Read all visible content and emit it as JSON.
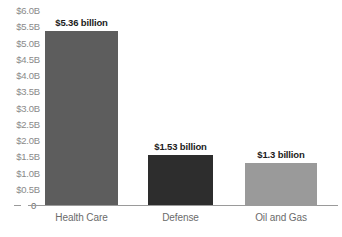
{
  "chart_data": {
    "type": "bar",
    "title": "",
    "subtitle": "",
    "xlabel": "",
    "ylabel": "",
    "categories": [
      "Health Care",
      "Defense",
      "Oil and Gas"
    ],
    "values": [
      5.36,
      1.53,
      1.3
    ],
    "value_labels": [
      "$5.36 billion",
      "$1.53 billion",
      "$1.3 billion"
    ],
    "bar_colors": [
      "#5d5d5d",
      "#2d2d2d",
      "#9a9a9a"
    ],
    "ylim": [
      0,
      6.0
    ],
    "grid": false,
    "legend": "none",
    "y_ticks": [
      {
        "value": 6.0,
        "label": "$6.0B"
      },
      {
        "value": 5.5,
        "label": "$5.5B"
      },
      {
        "value": 5.0,
        "label": "$5.0B"
      },
      {
        "value": 4.5,
        "label": "$4.5B"
      },
      {
        "value": 4.0,
        "label": "$4.0B"
      },
      {
        "value": 3.5,
        "label": "$3.5B"
      },
      {
        "value": 3.0,
        "label": "$3.0B"
      },
      {
        "value": 2.5,
        "label": "$2.5B"
      },
      {
        "value": 2.0,
        "label": "$2.0B"
      },
      {
        "value": 1.5,
        "label": "$1.5B"
      },
      {
        "value": 1.0,
        "label": "$1.0B"
      },
      {
        "value": 0.5,
        "label": "$0.5B"
      },
      {
        "value": 0.0,
        "label": "0"
      }
    ]
  }
}
